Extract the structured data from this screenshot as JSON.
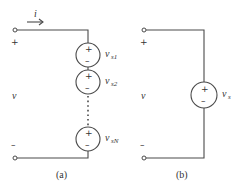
{
  "figure": {
    "panel_a": {
      "caption": "(a)",
      "current_label": "i",
      "voltage_label": "v",
      "plus_sign": "+",
      "minus_sign": "–",
      "sources": [
        {
          "label_main": "v",
          "label_sub": "s1",
          "plus": "+",
          "minus": "–"
        },
        {
          "label_main": "v",
          "label_sub": "s2",
          "plus": "+",
          "minus": "–"
        },
        {
          "label_main": "v",
          "label_sub": "sN",
          "plus": "+",
          "minus": "–"
        }
      ]
    },
    "panel_b": {
      "caption": "(b)",
      "voltage_label": "v",
      "plus_sign": "+",
      "minus_sign": "–",
      "source": {
        "label_main": "v",
        "label_sub": "s",
        "plus": "+",
        "minus": "–"
      }
    },
    "colors": {
      "line": "#4a4a4a",
      "text": "#333333",
      "background": "#ffffff"
    }
  }
}
